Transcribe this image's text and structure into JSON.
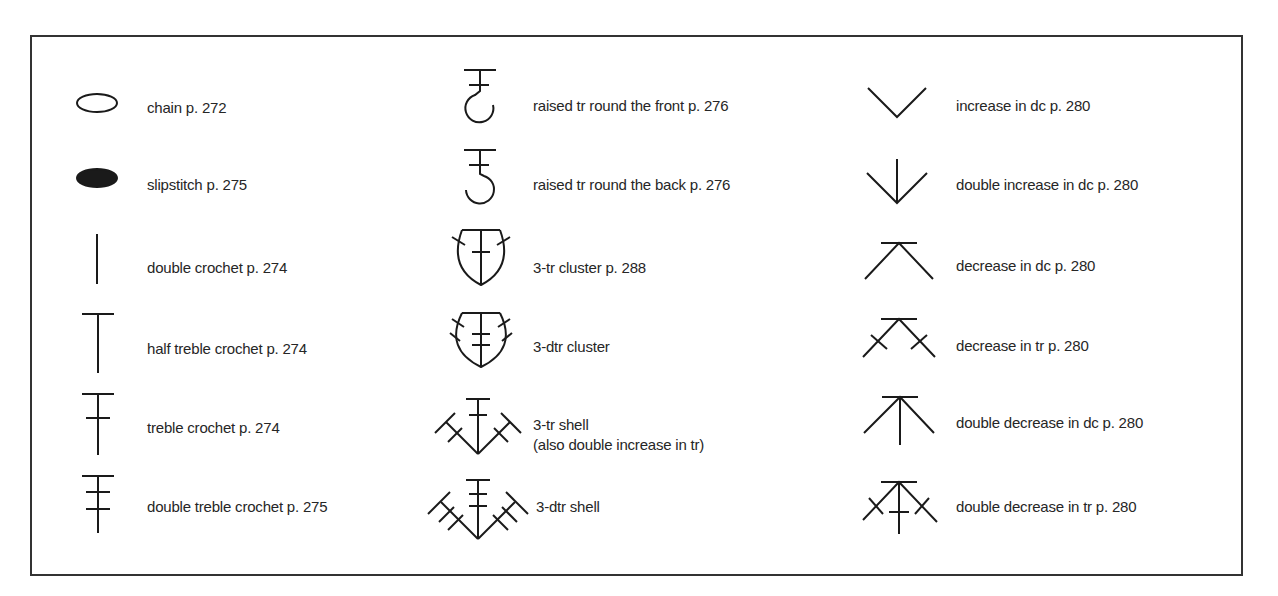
{
  "legend": {
    "columns": [
      {
        "items": [
          {
            "symbol": "chain-icon",
            "label": "chain p. 272"
          },
          {
            "symbol": "slipstitch-icon",
            "label": "slipstitch p. 275"
          },
          {
            "symbol": "double-crochet-icon",
            "label": "double crochet p. 274"
          },
          {
            "symbol": "half-treble-crochet-icon",
            "label": "half treble crochet p. 274"
          },
          {
            "symbol": "treble-crochet-icon",
            "label": "treble crochet p. 274"
          },
          {
            "symbol": "double-treble-crochet-icon",
            "label": "double treble crochet p. 275"
          }
        ]
      },
      {
        "items": [
          {
            "symbol": "raised-tr-front-icon",
            "label": "raised tr round the front p. 276"
          },
          {
            "symbol": "raised-tr-back-icon",
            "label": "raised tr round the back p. 276"
          },
          {
            "symbol": "3-tr-cluster-icon",
            "label": "3-tr cluster p. 288"
          },
          {
            "symbol": "3-dtr-cluster-icon",
            "label": "3-dtr cluster"
          },
          {
            "symbol": "3-tr-shell-icon",
            "label": "3-tr shell",
            "label2": "(also double increase in tr)"
          },
          {
            "symbol": "3-dtr-shell-icon",
            "label": "3-dtr shell"
          }
        ]
      },
      {
        "items": [
          {
            "symbol": "increase-dc-icon",
            "label": "increase in dc p. 280"
          },
          {
            "symbol": "double-increase-dc-icon",
            "label": "double increase in dc p. 280"
          },
          {
            "symbol": "decrease-dc-icon",
            "label": "decrease in dc p. 280"
          },
          {
            "symbol": "decrease-tr-icon",
            "label": "decrease in tr p. 280"
          },
          {
            "symbol": "double-decrease-dc-icon",
            "label": "double decrease in dc p. 280"
          },
          {
            "symbol": "double-decrease-tr-icon",
            "label": "double decrease in tr p. 280"
          }
        ]
      }
    ]
  }
}
